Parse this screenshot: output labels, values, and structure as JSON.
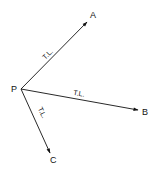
{
  "diagram": {
    "type": "vector-diagram",
    "stroke_color": "#111111",
    "background": "#ffffff",
    "origin": {
      "label": "P"
    },
    "vectors": [
      {
        "to": "A",
        "annotation": "T.L."
      },
      {
        "to": "B",
        "annotation": "T.L."
      },
      {
        "to": "C",
        "annotation": "T.L."
      }
    ]
  }
}
